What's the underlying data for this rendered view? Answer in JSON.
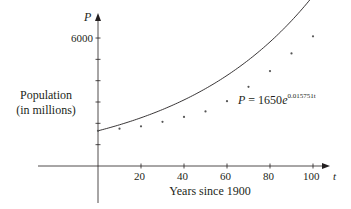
{
  "chart_data": {
    "type": "scatter",
    "title": "",
    "xlabel": "Years since 1900",
    "ylabel": "Population (in millions)",
    "x_axis_symbol": "t",
    "y_axis_symbol": "P",
    "xlim": [
      0,
      105
    ],
    "ylim": [
      0,
      6500
    ],
    "x_ticks": [
      20,
      40,
      60,
      80,
      100
    ],
    "y_ticks": [
      1000,
      2000,
      3000,
      4000,
      5000,
      6000
    ],
    "y_tick_labels_shown": [
      "6000"
    ],
    "grid": false,
    "series": [
      {
        "name": "Population data",
        "type": "scatter",
        "x": [
          0,
          10,
          20,
          30,
          40,
          50,
          60,
          70,
          80,
          90,
          100
        ],
        "y": [
          1650,
          1750,
          1860,
          2070,
          2300,
          2560,
          3040,
          3710,
          4450,
          5280,
          6080
        ]
      },
      {
        "name": "Exponential model",
        "type": "line",
        "formula": "P = 1650e^(0.015751t)",
        "a": 1650,
        "k": 0.015751,
        "domain": [
          0,
          100
        ]
      }
    ],
    "annotations": [
      {
        "text": "P = 1650e^(0.015751t)",
        "x": 64,
        "y": 2700
      }
    ]
  },
  "labels": {
    "y_axis_title_line1": "Population",
    "y_axis_title_line2": "(in millions)",
    "x_axis_title": "Years since 1900",
    "y_symbol": "P",
    "x_symbol": "t",
    "y_tick_6000": "6000",
    "x_tick_20": "20",
    "x_tick_40": "40",
    "x_tick_60": "60",
    "x_tick_80": "80",
    "x_tick_100": "100",
    "eq_lhs": "P",
    "eq_mid": " = 1650",
    "eq_e": "e",
    "eq_exp": "0.015751t"
  },
  "colors": {
    "ink": "#231f20",
    "points": "#555555"
  }
}
